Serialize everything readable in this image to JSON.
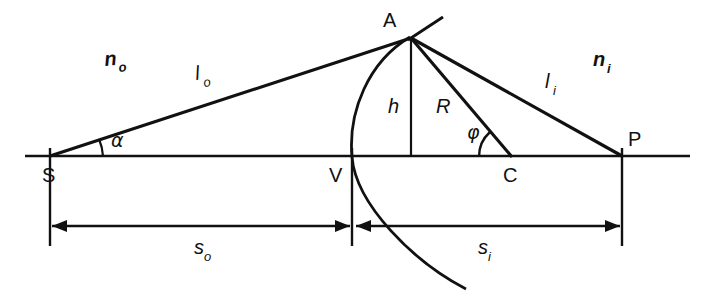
{
  "figure": {
    "domain_kind": "diagram",
    "background_color": "#ffffff",
    "ink_color": "#111111",
    "width": 703,
    "height": 299
  },
  "points": [
    {
      "id": "S",
      "label": "S",
      "x": 50,
      "y": 156,
      "desc": "object point on axis"
    },
    {
      "id": "V",
      "label": "V",
      "x": 352,
      "y": 156,
      "desc": "vertex of spherical surface"
    },
    {
      "id": "C",
      "label": "C",
      "x": 512,
      "y": 156,
      "desc": "center of curvature"
    },
    {
      "id": "P",
      "label": "P",
      "x": 622,
      "y": 156,
      "desc": "image point on axis"
    },
    {
      "id": "A",
      "label": "A",
      "x": 410,
      "y": 37,
      "desc": "point of refraction on surface"
    }
  ],
  "labels": {
    "point_S": "S",
    "point_V": "V",
    "point_C": "C",
    "point_P": "P",
    "point_A": "A",
    "index_object_base": "n",
    "index_object_sub": "o",
    "index_image_base": "n",
    "index_image_sub": "i",
    "ray_object_base": "l",
    "ray_object_sub": "o",
    "ray_image_base": "l",
    "ray_image_sub": "i",
    "height": "h",
    "radius": "R",
    "angle_alpha": "α",
    "angle_phi": "φ",
    "dist_object_base": "s",
    "dist_object_sub": "o",
    "dist_image_base": "s",
    "dist_image_sub": "i"
  },
  "segments": [
    {
      "name": "optical-axis",
      "from": "axis-left",
      "to": "axis-right"
    },
    {
      "name": "object-ray-l-o",
      "from": "S",
      "to": "A"
    },
    {
      "name": "image-ray-l-i",
      "from": "A",
      "to": "P"
    },
    {
      "name": "radius-R",
      "from": "A",
      "to": "C"
    },
    {
      "name": "height-h",
      "from": "A",
      "to": "foot-of-h"
    },
    {
      "name": "surface-normal-tangent",
      "from": "A",
      "to": "tangent-tip"
    }
  ],
  "dimensions": [
    {
      "name": "s_o",
      "label": "s",
      "sub": "o",
      "from_point": "S",
      "to_point": "V",
      "value_text": "sₒ"
    },
    {
      "name": "s_i",
      "label": "s",
      "sub": "i",
      "from_point": "V",
      "to_point": "P",
      "value_text": "sᵢ"
    }
  ],
  "annotations": {
    "object_space_medium": "nₒ",
    "image_space_medium": "nᵢ",
    "object_ray_length": "lₒ",
    "image_ray_length": "lᵢ",
    "perpendicular_height": "h",
    "radius_of_curvature": "R",
    "object_angle": "α",
    "center_angle": "φ"
  }
}
